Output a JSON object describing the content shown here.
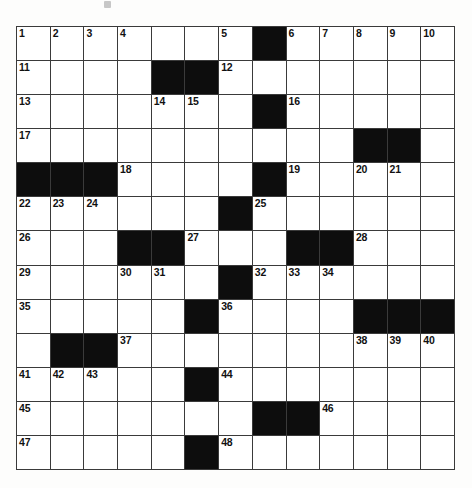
{
  "document": {
    "type": "crossword-puzzle-grid",
    "title": "",
    "columns": 13,
    "rows": 13,
    "background_color": "#ffffff",
    "block_color": "#0d0d0d",
    "cell_color": "#ffffff",
    "grid_line_color": "#3a3a3a"
  },
  "chart_data": {
    "type": "table",
    "columns": 13,
    "rows": 13,
    "legend": "0 = open (white) square, 1 = blocked (black) square",
    "grid": [
      [
        0,
        0,
        0,
        0,
        0,
        0,
        0,
        1,
        0,
        0,
        0,
        0,
        0
      ],
      [
        0,
        0,
        0,
        0,
        1,
        1,
        0,
        0,
        0,
        0,
        0,
        0,
        0
      ],
      [
        0,
        0,
        0,
        0,
        0,
        0,
        0,
        1,
        0,
        0,
        0,
        0,
        0
      ],
      [
        0,
        0,
        0,
        0,
        0,
        0,
        0,
        0,
        0,
        0,
        1,
        1,
        0
      ],
      [
        1,
        1,
        1,
        0,
        0,
        0,
        0,
        1,
        0,
        0,
        0,
        0,
        0
      ],
      [
        0,
        0,
        0,
        0,
        0,
        0,
        1,
        0,
        0,
        0,
        0,
        0,
        0
      ],
      [
        0,
        0,
        0,
        1,
        1,
        0,
        0,
        0,
        1,
        1,
        0,
        0,
        0
      ],
      [
        0,
        0,
        0,
        0,
        0,
        0,
        1,
        0,
        0,
        0,
        0,
        0,
        0
      ],
      [
        0,
        0,
        0,
        0,
        0,
        1,
        0,
        0,
        0,
        0,
        1,
        1,
        1
      ],
      [
        0,
        1,
        1,
        0,
        0,
        0,
        0,
        0,
        0,
        0,
        0,
        0,
        0
      ],
      [
        0,
        0,
        0,
        0,
        0,
        1,
        0,
        0,
        0,
        0,
        0,
        0,
        0
      ],
      [
        0,
        0,
        0,
        0,
        0,
        0,
        0,
        1,
        1,
        0,
        0,
        0,
        0
      ],
      [
        0,
        0,
        0,
        0,
        0,
        1,
        0,
        0,
        0,
        0,
        0,
        0,
        0
      ]
    ],
    "numbers": [
      {
        "n": 1,
        "row": 0,
        "col": 0
      },
      {
        "n": 2,
        "row": 0,
        "col": 1
      },
      {
        "n": 3,
        "row": 0,
        "col": 2
      },
      {
        "n": 4,
        "row": 0,
        "col": 3
      },
      {
        "n": 5,
        "row": 0,
        "col": 6
      },
      {
        "n": 6,
        "row": 0,
        "col": 8
      },
      {
        "n": 7,
        "row": 0,
        "col": 9
      },
      {
        "n": 8,
        "row": 0,
        "col": 10
      },
      {
        "n": 9,
        "row": 0,
        "col": 11
      },
      {
        "n": 10,
        "row": 0,
        "col": 12
      },
      {
        "n": 11,
        "row": 1,
        "col": 0
      },
      {
        "n": 12,
        "row": 1,
        "col": 6
      },
      {
        "n": 13,
        "row": 2,
        "col": 0
      },
      {
        "n": 14,
        "row": 2,
        "col": 4
      },
      {
        "n": 15,
        "row": 2,
        "col": 5
      },
      {
        "n": 16,
        "row": 2,
        "col": 8
      },
      {
        "n": 17,
        "row": 3,
        "col": 0
      },
      {
        "n": 18,
        "row": 4,
        "col": 3
      },
      {
        "n": 19,
        "row": 4,
        "col": 8
      },
      {
        "n": 20,
        "row": 4,
        "col": 10
      },
      {
        "n": 21,
        "row": 4,
        "col": 11
      },
      {
        "n": 22,
        "row": 5,
        "col": 0
      },
      {
        "n": 23,
        "row": 5,
        "col": 1
      },
      {
        "n": 24,
        "row": 5,
        "col": 2
      },
      {
        "n": 25,
        "row": 5,
        "col": 7
      },
      {
        "n": 26,
        "row": 6,
        "col": 0
      },
      {
        "n": 27,
        "row": 6,
        "col": 5
      },
      {
        "n": 28,
        "row": 6,
        "col": 10
      },
      {
        "n": 29,
        "row": 7,
        "col": 0
      },
      {
        "n": 30,
        "row": 7,
        "col": 3
      },
      {
        "n": 31,
        "row": 7,
        "col": 4
      },
      {
        "n": 32,
        "row": 7,
        "col": 7
      },
      {
        "n": 33,
        "row": 7,
        "col": 8
      },
      {
        "n": 34,
        "row": 7,
        "col": 9
      },
      {
        "n": 35,
        "row": 8,
        "col": 0
      },
      {
        "n": 36,
        "row": 8,
        "col": 6
      },
      {
        "n": 37,
        "row": 9,
        "col": 3
      },
      {
        "n": 38,
        "row": 9,
        "col": 10
      },
      {
        "n": 39,
        "row": 9,
        "col": 11
      },
      {
        "n": 40,
        "row": 9,
        "col": 12
      },
      {
        "n": 41,
        "row": 10,
        "col": 0
      },
      {
        "n": 42,
        "row": 10,
        "col": 1
      },
      {
        "n": 43,
        "row": 10,
        "col": 2
      },
      {
        "n": 44,
        "row": 10,
        "col": 6
      },
      {
        "n": 45,
        "row": 11,
        "col": 0
      },
      {
        "n": 46,
        "row": 11,
        "col": 9
      },
      {
        "n": 47,
        "row": 12,
        "col": 0
      },
      {
        "n": 48,
        "row": 12,
        "col": 6
      }
    ],
    "letters": []
  }
}
